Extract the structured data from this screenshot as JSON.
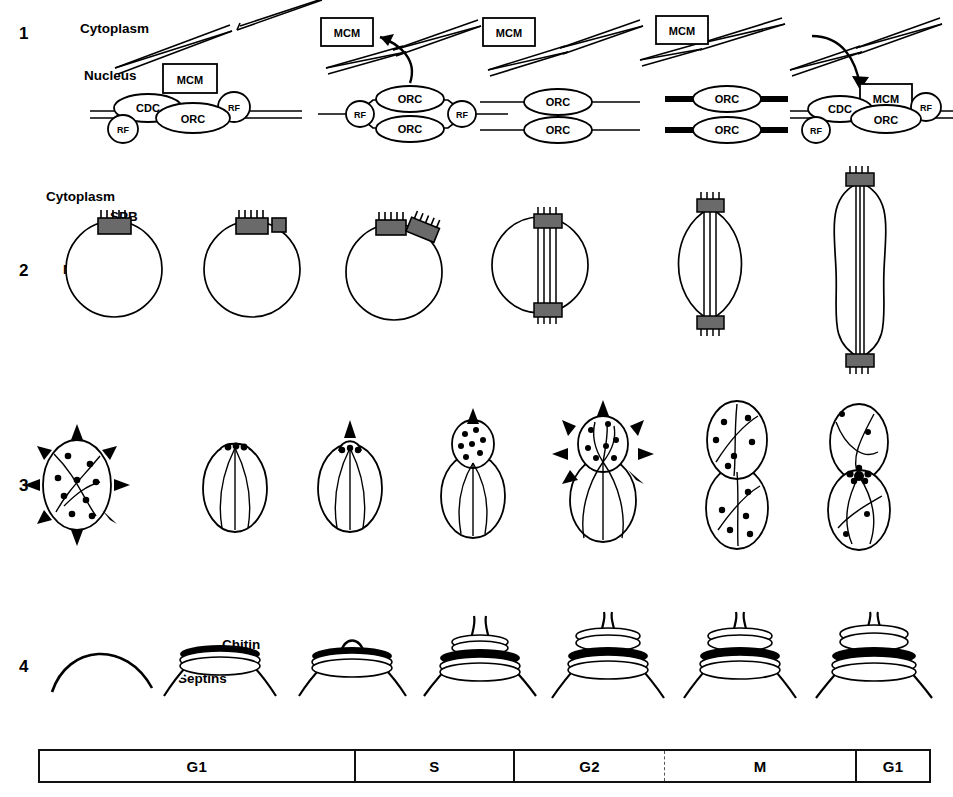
{
  "figure": {
    "background": "#ffffff",
    "ink_color": "#000000",
    "width": 953,
    "height": 797
  },
  "rows": [
    {
      "number": "1",
      "name": "dna-replication-row",
      "labels": {
        "cytoplasm": "Cytoplasm",
        "nucleus": "Nucleus"
      },
      "complex_labels": {
        "mcm": "MCM",
        "orc": "ORC",
        "cdc": "CDC",
        "rf": "RF"
      },
      "panels": [
        {
          "id": "p1",
          "description": "Pre-replicative complex at origin: CDC, MCM box, ORC and two RF circles on duplex DNA"
        },
        {
          "id": "p2",
          "description": "MCM released to cytoplasm; replication bubble opened with two ORC and two RF at forks"
        },
        {
          "id": "p3",
          "description": "MCM in cytoplasm; two separated daughter duplexes each bearing an ORC"
        },
        {
          "id": "p4",
          "description": "MCM in cytoplasm; two duplexes with ORC flanked by thick black DNA segments"
        },
        {
          "id": "p5",
          "description": "MCM re-imported into nucleus; pre-replicative complex reassembled with CDC, ORC and RF"
        }
      ]
    },
    {
      "number": "2",
      "name": "spindle-pole-body-row",
      "labels": {
        "cytoplasm": "Cytoplasm",
        "spb": "SPB",
        "nucleus": "Nucleus"
      },
      "panels": [
        {
          "id": "p1",
          "description": "Round nucleus with a single spindle pole body embedded in the envelope"
        },
        {
          "id": "p2",
          "description": "SPB with adjacent satellite / duplication plaque"
        },
        {
          "id": "p3",
          "description": "Side-by-side duplicated spindle pole bodies"
        },
        {
          "id": "p4",
          "description": "Short bipolar spindle inside round nucleus, SPBs at opposite poles"
        },
        {
          "id": "p5",
          "description": "Elongated nucleus with extended spindle microtubules"
        },
        {
          "id": "p6",
          "description": "Fully elongated anaphase spindle, dumbbell-shaped nucleus spanning mother and bud"
        }
      ]
    },
    {
      "number": "3",
      "name": "actin-cytoskeleton-row",
      "panels": [
        {
          "id": "p1",
          "description": "Unbudded cell with randomly distributed actin patches and isotropic arrows of growth"
        },
        {
          "id": "p2",
          "description": "Actin patches clustered at the presumptive bud site, cables oriented to the tip"
        },
        {
          "id": "p3",
          "description": "Emerging bud with patches at the tip and a single apical growth arrow"
        },
        {
          "id": "p4",
          "description": "Small bud filled with actin patches, apical growth arrow"
        },
        {
          "id": "p5",
          "description": "Medium bud with isotropic growth arrows and patches in both bud and mother"
        },
        {
          "id": "p6",
          "description": "Large bud and mother, actin patches randomized, cables across both"
        },
        {
          "id": "p7",
          "description": "Cytokinesis: actin concentrated as a ring at the mother-bud neck"
        }
      ]
    },
    {
      "number": "4",
      "name": "bud-neck-row",
      "labels": {
        "chitin": "Chitin",
        "septins": "Septins"
      },
      "panels": [
        {
          "id": "p1",
          "description": "Unbudded cell surface, no chitin ring"
        },
        {
          "id": "p2",
          "description": "Chitin ring deposited with septin filaments underlying the presumptive bud site"
        },
        {
          "id": "p3",
          "description": "Bud emergence through the chitin ring"
        },
        {
          "id": "p4",
          "description": "Bud neck with double septin rings and chitin collar"
        },
        {
          "id": "p5",
          "description": "Hourglass septin collar at the neck"
        },
        {
          "id": "p6",
          "description": "Persistent hourglass septin collar during mitosis"
        },
        {
          "id": "p7",
          "description": "Septin ring splitting at cytokinesis"
        }
      ]
    }
  ],
  "timeline": {
    "name": "cell-cycle-phase-bar",
    "phases": [
      {
        "label": "G1",
        "width_pct": 35.3,
        "divider": "solid"
      },
      {
        "label": "S",
        "width_pct": 17.9,
        "divider": "solid"
      },
      {
        "label": "G2",
        "width_pct": 17.0,
        "divider": "solid"
      },
      {
        "label": "M",
        "width_pct": 21.5,
        "divider": "dashed"
      },
      {
        "label": "G1",
        "width_pct": 8.3,
        "divider": "solid"
      }
    ]
  }
}
